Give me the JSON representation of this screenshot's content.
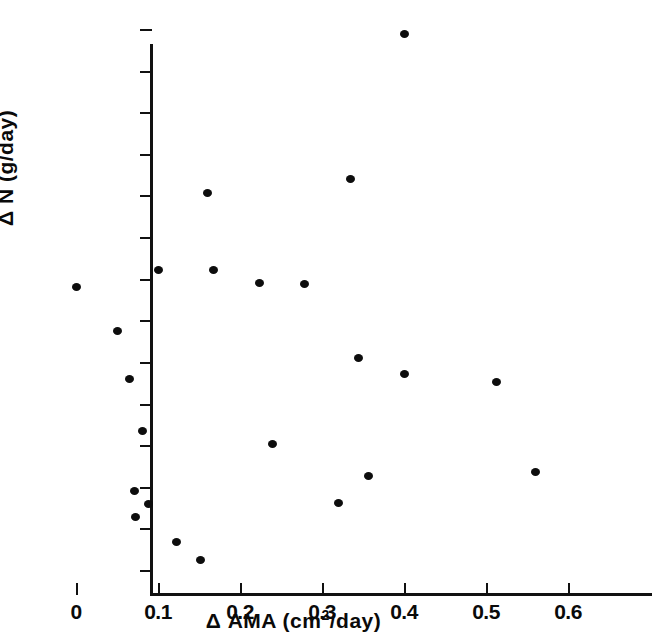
{
  "chart_data": {
    "type": "scatter",
    "title": "",
    "xlabel": "Δ AMA (cm²/day)",
    "ylabel": "Δ N (g/day)",
    "xlabel_prefix": "Δ AMA (cm",
    "xlabel_sup": "2",
    "xlabel_suffix": "/day)",
    "xlim": [
      0,
      0.6
    ],
    "ylim": [
      -1,
      12
    ],
    "grid": false,
    "legend": "none",
    "marker": "filled-circle",
    "marker_color": "#0d0d0d",
    "axis_color": "#111111",
    "background": "#ffffff",
    "xticks": [
      0,
      0.1,
      0.2,
      0.3,
      0.4,
      0.5,
      0.6
    ],
    "xtick_labels": [
      "0",
      "0.1",
      "0.2",
      "0.3",
      "0.4",
      "0.5",
      "0.6"
    ],
    "yticks": [
      12,
      11,
      10,
      9,
      8,
      7,
      6,
      5,
      4,
      3,
      2,
      1,
      0,
      -1
    ],
    "ytick_labels": [
      "12",
      "11",
      "10",
      "9",
      "8",
      "7",
      "6",
      "5",
      "4",
      "3",
      "2",
      "1",
      "0",
      "-1"
    ],
    "n_points": 23,
    "points": [
      {
        "x": 0.4,
        "y": 11.87
      },
      {
        "x": 0.335,
        "y": 8.4
      },
      {
        "x": 0.16,
        "y": 8.07
      },
      {
        "x": 0.1,
        "y": 6.2
      },
      {
        "x": 0.168,
        "y": 6.2
      },
      {
        "x": 0.224,
        "y": 5.9
      },
      {
        "x": 0.279,
        "y": 5.87
      },
      {
        "x": 0.0,
        "y": 5.8
      },
      {
        "x": 0.05,
        "y": 4.75
      },
      {
        "x": 0.345,
        "y": 4.1
      },
      {
        "x": 0.4,
        "y": 3.7
      },
      {
        "x": 0.065,
        "y": 3.58
      },
      {
        "x": 0.513,
        "y": 3.52
      },
      {
        "x": 0.081,
        "y": 2.33
      },
      {
        "x": 0.24,
        "y": 2.02
      },
      {
        "x": 0.56,
        "y": 1.35
      },
      {
        "x": 0.357,
        "y": 1.27
      },
      {
        "x": 0.071,
        "y": 0.91
      },
      {
        "x": 0.32,
        "y": 0.62
      },
      {
        "x": 0.088,
        "y": 0.58
      },
      {
        "x": 0.073,
        "y": 0.27
      },
      {
        "x": 0.123,
        "y": -0.33
      },
      {
        "x": 0.152,
        "y": -0.75
      }
    ]
  }
}
